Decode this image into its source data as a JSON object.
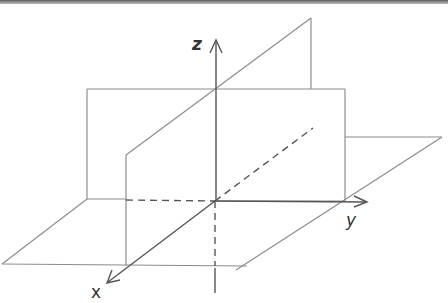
{
  "figure": {
    "title": "",
    "axes": {
      "x": {
        "label": "x"
      },
      "y": {
        "label": "y"
      },
      "z": {
        "label": "z"
      }
    },
    "colors": {
      "line": "#8a8a8a",
      "axis": "#555555",
      "label": "#333333",
      "background": "#ffffff"
    }
  }
}
